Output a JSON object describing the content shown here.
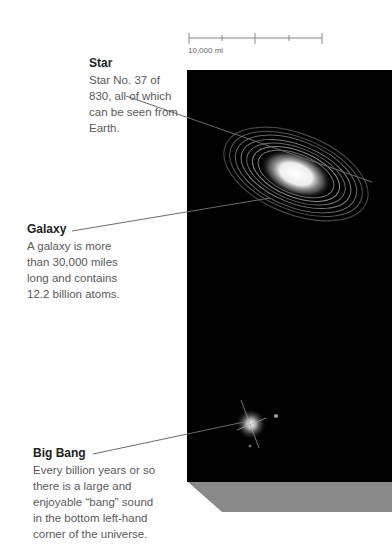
{
  "scale_bar": {
    "label": "10,000 mi",
    "ticks": 5
  },
  "callouts": [
    {
      "id": "star",
      "title": "Star",
      "lines": [
        "Star No. 37 of",
        "830, all of which",
        "can be seen from",
        "Earth."
      ]
    },
    {
      "id": "galaxy",
      "title": "Galaxy",
      "lines": [
        "A galaxy is more",
        "than 30,000 miles",
        "long and contains",
        "12.2 billion atoms."
      ]
    },
    {
      "id": "big-bang",
      "title": "Big Bang",
      "lines": [
        "Every billion years or so",
        "there is a large and",
        "enjoyable “bang” sound",
        "in the bottom left-hand",
        "corner of the universe."
      ]
    }
  ],
  "colors": {
    "space": "#000000",
    "bevel": "#8a8a8a",
    "leader": "#6a6a6a",
    "title_text": "#222222",
    "body_text": "#5a5a5a"
  }
}
